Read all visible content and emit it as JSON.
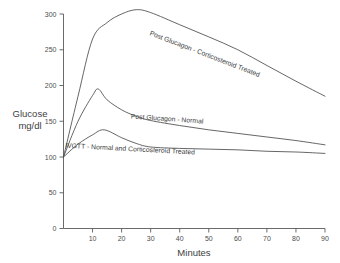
{
  "chart_data": {
    "type": "line",
    "title": "",
    "xlabel": "Minutes",
    "ylabel_line1": "Glucose",
    "ylabel_line2": "mg/dl",
    "ylabel": "Glucose mg/dl",
    "xlim": [
      0,
      93
    ],
    "ylim": [
      0,
      310
    ],
    "grid": false,
    "legend_position": "inline-along-curves",
    "xticks": [
      10,
      20,
      30,
      40,
      50,
      60,
      70,
      80,
      90
    ],
    "xtick_labels": [
      "10",
      "20",
      "30",
      "40",
      "50",
      "60",
      "70",
      "80",
      "90"
    ],
    "yticks": [
      0,
      50,
      100,
      150,
      200,
      250,
      300
    ],
    "ytick_labels": [
      "0",
      "50",
      "100",
      "150",
      "200",
      "250",
      "300"
    ],
    "series": [
      {
        "name": "Post Glucagon - Corticosteroid Treated",
        "label_angle_deg": 21,
        "x": [
          0,
          5,
          10,
          15,
          20,
          25,
          30,
          40,
          50,
          60,
          70,
          80,
          90
        ],
        "values": [
          100,
          185,
          265,
          288,
          300,
          306,
          302,
          285,
          268,
          250,
          228,
          206,
          185
        ]
      },
      {
        "name": "Post Glucagon - Normal",
        "label_angle_deg": 4,
        "x": [
          0,
          5,
          10,
          12,
          15,
          20,
          25,
          30,
          40,
          50,
          60,
          70,
          80,
          90
        ],
        "values": [
          100,
          150,
          186,
          195,
          180,
          166,
          157,
          151,
          144,
          138,
          133,
          128,
          123,
          117
        ]
      },
      {
        "name": "IVGTT - Normal and Corticosteroid Treated",
        "label_angle_deg": 3,
        "x": [
          0,
          5,
          10,
          14,
          20,
          25,
          30,
          40,
          50,
          60,
          70,
          80,
          90
        ],
        "values": [
          100,
          118,
          131,
          138,
          127,
          119,
          114,
          112,
          111,
          110,
          108,
          107,
          105
        ]
      }
    ],
    "annotations": [
      {
        "text": "Post Glucagon - Corticosteroid Treated",
        "x_px": 204,
        "y_px": 56,
        "rotate": 21
      },
      {
        "text": "Post Glucagon - Normal",
        "x_px": 167,
        "y_px": 121,
        "rotate": 4
      },
      {
        "text": "IVGTT - Normal and Corticosteroid Treated",
        "x_px": 130,
        "y_px": 151,
        "rotate": 3
      }
    ],
    "colors": {
      "curve": "#4a4a4a",
      "axis": "#5a5a5a",
      "text": "#3d3d3d",
      "background": "#ffffff"
    }
  }
}
